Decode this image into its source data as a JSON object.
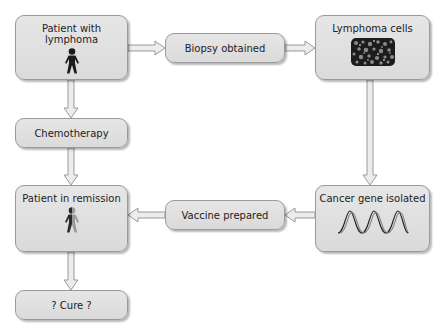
{
  "diagram": {
    "nodes": [
      {
        "id": "patient_lymphoma",
        "label": "Patient with lymphoma",
        "icon": "person-icon"
      },
      {
        "id": "biopsy",
        "label": "Biopsy obtained"
      },
      {
        "id": "lymphoma_cells",
        "label": "Lymphoma cells",
        "icon": "cells-micrograph-icon"
      },
      {
        "id": "chemotherapy",
        "label": "Chemotherapy"
      },
      {
        "id": "cancer_gene",
        "label": "Cancer gene isolated",
        "icon": "dna-helix-icon"
      },
      {
        "id": "vaccine",
        "label": "Vaccine prepared"
      },
      {
        "id": "remission",
        "label": "Patient in remission",
        "icon": "half-faded-person-icon"
      },
      {
        "id": "cure",
        "label": "? Cure ?"
      }
    ],
    "edges": [
      {
        "from": "patient_lymphoma",
        "to": "biopsy"
      },
      {
        "from": "biopsy",
        "to": "lymphoma_cells"
      },
      {
        "from": "patient_lymphoma",
        "to": "chemotherapy"
      },
      {
        "from": "chemotherapy",
        "to": "remission"
      },
      {
        "from": "lymphoma_cells",
        "to": "cancer_gene"
      },
      {
        "from": "cancer_gene",
        "to": "vaccine"
      },
      {
        "from": "vaccine",
        "to": "remission"
      },
      {
        "from": "remission",
        "to": "cure"
      }
    ],
    "colors": {
      "box_fill": "#dedede",
      "box_border": "#9a9a9a",
      "arrow_fill": "#e8e8e8",
      "arrow_stroke": "#9a9a9a",
      "figure": "#1a1a1a"
    }
  }
}
